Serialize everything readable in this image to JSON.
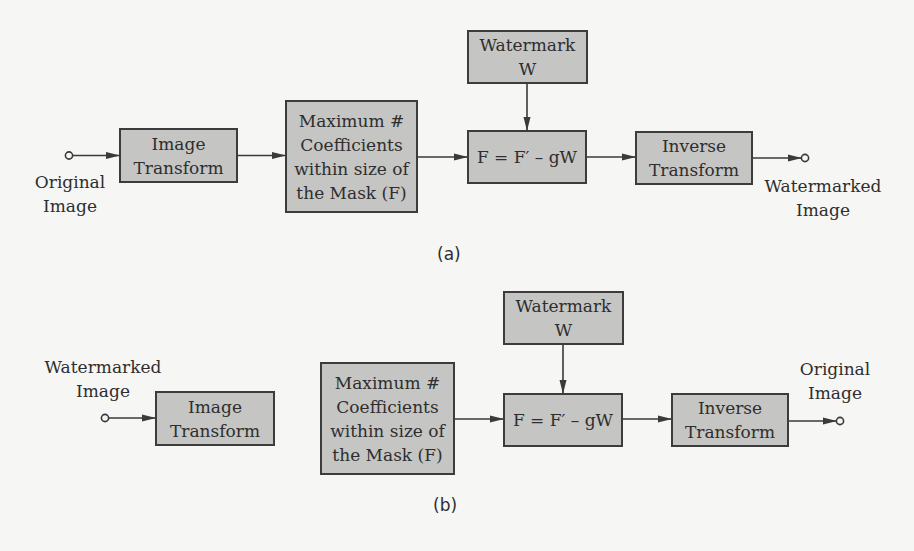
{
  "diagram": {
    "colors": {
      "background": "#f6f6f5",
      "box_fill": "#c5c5c4",
      "box_border": "#3c3c3c",
      "line": "#3a3a3a",
      "text": "#2e2e2e"
    },
    "panel_a": {
      "caption": "(a)",
      "input_label": [
        "Original",
        "Image"
      ],
      "output_label": [
        "Watermarked",
        "Image"
      ],
      "boxes": {
        "image_transform": [
          "Image",
          "Transform"
        ],
        "max_coefficients": [
          "Maximum #",
          "Coefficients",
          "within size of",
          "the Mask (F)"
        ],
        "watermark": [
          "Watermark",
          "W"
        ],
        "formula": "F = F′ – gW",
        "inverse_transform": [
          "Inverse",
          "Transform"
        ]
      },
      "flow": [
        "Original Image",
        "Image Transform",
        "Maximum # Coefficients within size of the Mask (F)",
        "F = F′ – gW",
        "Inverse Transform",
        "Watermarked Image"
      ],
      "side_input": "Watermark W → F = F′ – gW"
    },
    "panel_b": {
      "caption": "(b)",
      "input_label": [
        "Watermarked",
        "Image"
      ],
      "output_label": [
        "Original",
        "Image"
      ],
      "boxes": {
        "image_transform": [
          "Image",
          "Transform"
        ],
        "max_coefficients": [
          "Maximum #",
          "Coefficients",
          "within size of",
          "the Mask (F)"
        ],
        "watermark": [
          "Watermark",
          "W"
        ],
        "formula": "F = F′ – gW",
        "inverse_transform": [
          "Inverse",
          "Transform"
        ]
      },
      "flow": [
        "Watermarked Image",
        "Image Transform",
        "Maximum # Coefficients within size of the Mask (F)",
        "F = F′ – gW",
        "Inverse Transform",
        "Original Image"
      ],
      "side_input": "Watermark W → F = F′ – gW"
    }
  }
}
